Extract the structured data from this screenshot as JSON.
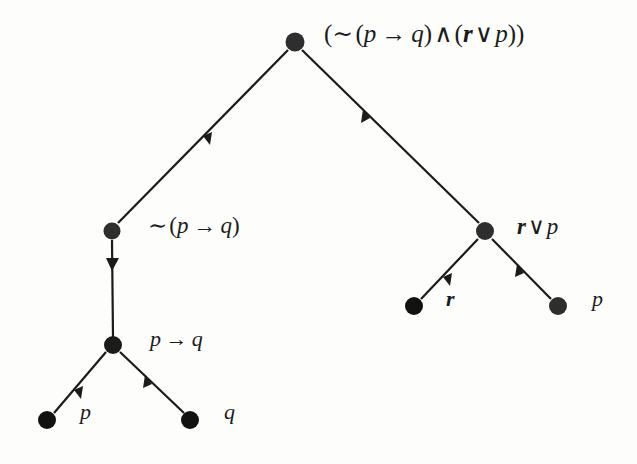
{
  "figure": {
    "type": "parse-tree",
    "background_color": "#fdfdfb",
    "ink_color": "#1b1b1b"
  },
  "tree": {
    "nodes": [
      {
        "id": "root",
        "label": "(∼ (p → q) ∧ (r ∨ p))",
        "x": 295,
        "y": 42,
        "radius": 9.5
      },
      {
        "id": "notpq",
        "label": "∼ (p → q)",
        "x": 112,
        "y": 231,
        "radius": 8.5
      },
      {
        "id": "rvp",
        "label": "r ∨ p",
        "x": 485,
        "y": 231,
        "radius": 9
      },
      {
        "id": "pq",
        "label": "p → q",
        "x": 113,
        "y": 345,
        "radius": 9
      },
      {
        "id": "leaf_p1",
        "label": "p",
        "x": 47,
        "y": 420,
        "radius": 9
      },
      {
        "id": "leaf_q1",
        "label": "q",
        "x": 190,
        "y": 420,
        "radius": 9
      },
      {
        "id": "leaf_r",
        "label": "r",
        "x": 414,
        "y": 306,
        "radius": 9
      },
      {
        "id": "leaf_p2",
        "label": "p",
        "x": 558,
        "y": 306,
        "radius": 9
      }
    ],
    "edges": [
      {
        "from": "root",
        "to": "notpq"
      },
      {
        "from": "root",
        "to": "rvp"
      },
      {
        "from": "notpq",
        "to": "pq"
      },
      {
        "from": "rvp",
        "to": "leaf_r"
      },
      {
        "from": "rvp",
        "to": "leaf_p2"
      },
      {
        "from": "pq",
        "to": "leaf_p1"
      },
      {
        "from": "pq",
        "to": "leaf_q1"
      }
    ]
  },
  "labels": {
    "root": {
      "full": "(∼ (p → q) ∧ (r ∨ p))",
      "open1": "(",
      "not": "∼",
      "open2": "(",
      "p": "p",
      "arrow": "→",
      "q": "q",
      "close2": ")",
      "and": "∧",
      "open3": "(",
      "r": "r",
      "or": "∨",
      "p2": "p",
      "close3": ")",
      "close1": ")"
    },
    "notpq": {
      "full": "∼ (p → q)",
      "not": "∼",
      "open": "(",
      "p": "p",
      "arrow": "→",
      "q": "q",
      "close": ")"
    },
    "rvp": {
      "full": "r ∨ p",
      "r": "r",
      "or": "∨",
      "p": "p"
    },
    "pq": {
      "full": "p → q",
      "p": "p",
      "arrow": "→",
      "q": "q"
    },
    "leaf_p1": "p",
    "leaf_q1": "q",
    "leaf_r": "r",
    "leaf_p2": "p"
  }
}
